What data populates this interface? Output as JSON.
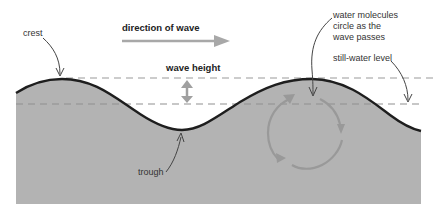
{
  "diagram": {
    "title_label": "direction of wave",
    "labels": {
      "crest": "crest",
      "trough": "trough",
      "wave_height": "wave height",
      "molecules_line1": "water molecules",
      "molecules_line2": "circle as the",
      "molecules_line3": "wave passes",
      "still_water": "still-water level"
    },
    "colors": {
      "water_fill": "#b3b3b3",
      "wave_line": "#1e1e1e",
      "dashed_line": "#9a9a9a",
      "arrow_gray": "#a0a0a0",
      "circle_gray": "#999999",
      "text": "#333333"
    }
  }
}
